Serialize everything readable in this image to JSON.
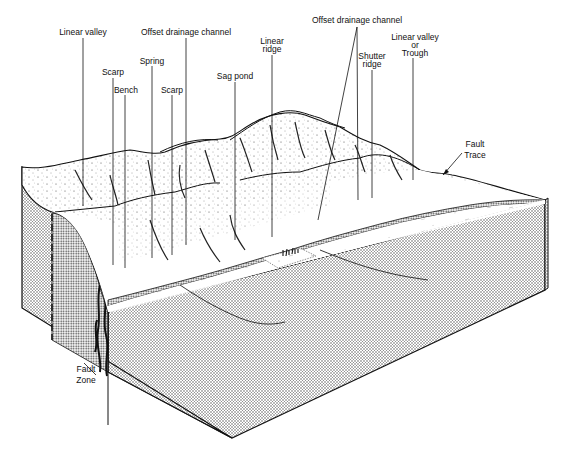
{
  "diagram": {
    "title": "",
    "type": "geologic-block-diagram",
    "labels": [
      {
        "id": "linear-valley",
        "text": "Linear valley",
        "x": 72,
        "y": 30
      },
      {
        "id": "offset-drainage-channel-left",
        "text": "Offset drainage channel",
        "x": 187,
        "y": 30
      },
      {
        "id": "offset-drainage-channel-right",
        "text": "Offset drainage channel",
        "x": 376,
        "y": 17
      },
      {
        "id": "linear-ridge",
        "text": "Linear\nridge",
        "x": 272,
        "y": 40
      },
      {
        "id": "scarp-left",
        "text": "Scarp",
        "x": 113,
        "y": 70
      },
      {
        "id": "spring",
        "text": "Spring",
        "x": 152,
        "y": 58
      },
      {
        "id": "sag-pond",
        "text": "Sag pond",
        "x": 235,
        "y": 73
      },
      {
        "id": "bench",
        "text": "Bench",
        "x": 125,
        "y": 87
      },
      {
        "id": "scarp-right",
        "text": "Scarp",
        "x": 172,
        "y": 87
      },
      {
        "id": "shutter-ridge",
        "text": "Shutter\nridge",
        "x": 372,
        "y": 57
      },
      {
        "id": "linear-valley-or-trough",
        "text": "Linear valley\nor\nTrough",
        "x": 415,
        "y": 40
      },
      {
        "id": "fault-trace",
        "text": "Fault\nTrace",
        "x": 477,
        "y": 145
      },
      {
        "id": "fault-zone",
        "text": "Fault\nZone",
        "x": 87,
        "y": 372
      }
    ]
  },
  "text": {
    "linear_valley": "Linear valley",
    "offset_left": "Offset drainage channel",
    "offset_right": "Offset drainage channel",
    "linear_ridge_1": "Linear",
    "linear_ridge_2": "ridge",
    "scarp_left": "Scarp",
    "spring": "Spring",
    "sag_pond": "Sag pond",
    "bench": "Bench",
    "scarp_right": "Scarp",
    "shutter_1": "Shutter",
    "shutter_2": "ridge",
    "lv_trough_1": "Linear valley",
    "lv_trough_2": "or",
    "lv_trough_3": "Trough",
    "fault_trace_1": "Fault",
    "fault_trace_2": "Trace",
    "fault_zone_1": "Fault",
    "fault_zone_2": "Zone"
  },
  "colors": {
    "ink": "#111111",
    "paper": "#ffffff",
    "stipple": "#555555",
    "face": "#bdbdbd"
  }
}
